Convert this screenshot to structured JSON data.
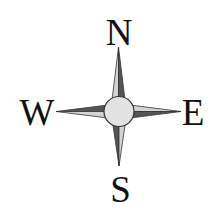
{
  "compass": {
    "labels": {
      "north": "N",
      "south": "S",
      "west": "W",
      "east": "E"
    },
    "colors": {
      "background": "#ffffff",
      "dark_shade": "#555555",
      "light_shade": "#d4d4d4",
      "outline": "#333333",
      "hub_fill": "#e2e2e2",
      "letter": "#111111"
    }
  }
}
